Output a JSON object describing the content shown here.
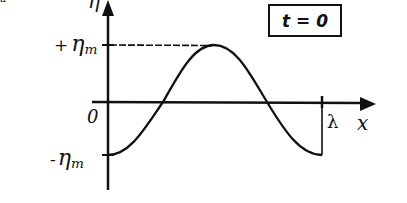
{
  "diagram": {
    "title_box": "t = 0",
    "y_axis_label": "η",
    "x_axis_label": "x",
    "y_tick_labels": {
      "plus_amplitude_sign": "+",
      "plus_amplitude_symbol": "η",
      "plus_amplitude_sub": "m",
      "zero": "0",
      "minus_amplitude_sign": "-",
      "minus_amplitude_symbol": "η",
      "minus_amplitude_sub": "m"
    },
    "wavelength_label": "λ",
    "corner_mark": "a",
    "curve": {
      "type": "cosine",
      "form": "η = -η_m cos(2πx/λ)",
      "x_range": [
        0,
        "λ"
      ],
      "start_value": "-η_m",
      "peak_value": "+η_m",
      "end_value": "-η_m"
    },
    "colors": {
      "ink": "#111111",
      "background": "#ffffff"
    }
  }
}
